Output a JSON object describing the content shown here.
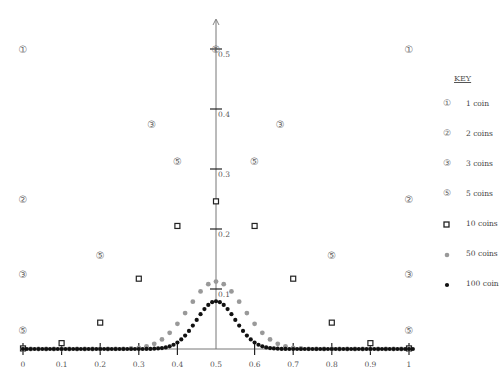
{
  "chart_data": {
    "type": "scatter",
    "title": "",
    "xlabel": "",
    "ylabel": "",
    "xlim": [
      0,
      1
    ],
    "ylim": [
      0,
      0.5
    ],
    "grid": false,
    "legend_position": "right",
    "x_ticks": [
      "0",
      "0.1",
      "0.2",
      "0.3",
      "0.4",
      "0.5",
      "0.6",
      "0.7",
      "0.8",
      "0.9",
      "1"
    ],
    "y_ticks": [
      "0.1",
      "0.2",
      "0.3",
      "0.4",
      "0.5"
    ],
    "legend_title": "KEY",
    "series": [
      {
        "name": "1 coin",
        "marker": "①",
        "x": [
          0,
          1
        ],
        "y": [
          0.5,
          0.5
        ]
      },
      {
        "name": "2 coins",
        "marker": "②",
        "x": [
          0,
          0.5,
          1
        ],
        "y": [
          0.25,
          0.5,
          0.25
        ]
      },
      {
        "name": "3 coins",
        "marker": "③",
        "x": [
          0,
          0.3333,
          0.6667,
          1
        ],
        "y": [
          0.125,
          0.375,
          0.375,
          0.125
        ]
      },
      {
        "name": "5 coins",
        "marker": "⑤",
        "x": [
          0,
          0.2,
          0.4,
          0.6,
          0.8,
          1
        ],
        "y": [
          0.03125,
          0.15625,
          0.3125,
          0.3125,
          0.15625,
          0.03125
        ]
      },
      {
        "name": "10 coins",
        "marker": "square",
        "x": [
          0,
          0.1,
          0.2,
          0.3,
          0.4,
          0.5,
          0.6,
          0.7,
          0.8,
          0.9,
          1
        ],
        "y": [
          0.000977,
          0.009766,
          0.043945,
          0.117188,
          0.205078,
          0.246094,
          0.205078,
          0.117188,
          0.043945,
          0.009766,
          0.000977
        ]
      },
      {
        "name": "50 coins",
        "marker": "gray-dot",
        "n": 50,
        "y": [
          0,
          0,
          0,
          0,
          0,
          0,
          0,
          0,
          0,
          0,
          0,
          0,
          0.0001,
          0.0003,
          0.0008,
          0.002,
          0.0044,
          0.0087,
          0.016,
          0.027,
          0.0419,
          0.0598,
          0.0788,
          0.096,
          0.108,
          0.1123,
          0.108,
          0.096,
          0.0788,
          0.0598,
          0.0419,
          0.027,
          0.016,
          0.0087,
          0.0044,
          0.002,
          0.0008,
          0.0003,
          0.0001,
          0,
          0,
          0,
          0,
          0,
          0,
          0,
          0,
          0,
          0,
          0,
          0
        ]
      },
      {
        "name": "100 coins",
        "marker": "black-dot",
        "n": 100,
        "y": [
          0,
          0,
          0,
          0,
          0,
          0,
          0,
          0,
          0,
          0,
          0,
          0,
          0,
          0,
          0,
          0,
          0,
          0,
          0,
          0,
          0,
          0,
          0,
          0,
          0,
          0,
          0,
          0,
          0,
          0,
          0,
          0,
          0.0001,
          0.0002,
          0.0005,
          0.0009,
          0.0016,
          0.0027,
          0.0045,
          0.0071,
          0.0108,
          0.0159,
          0.0223,
          0.0301,
          0.039,
          0.0485,
          0.058,
          0.0666,
          0.0735,
          0.078,
          0.0796,
          0.078,
          0.0735,
          0.0666,
          0.058,
          0.0485,
          0.039,
          0.0301,
          0.0223,
          0.0159,
          0.0108,
          0.0071,
          0.0045,
          0.0027,
          0.0016,
          0.0009,
          0.0005,
          0.0002,
          0.0001,
          0,
          0,
          0,
          0,
          0,
          0,
          0,
          0,
          0,
          0,
          0,
          0,
          0,
          0,
          0,
          0,
          0,
          0,
          0,
          0,
          0,
          0,
          0,
          0,
          0,
          0,
          0,
          0,
          0,
          0,
          0,
          0,
          0
        ]
      }
    ]
  },
  "key": {
    "title": "KEY",
    "items": [
      {
        "symbol": "①",
        "label": "1 coin"
      },
      {
        "symbol": "②",
        "label": "2 coins"
      },
      {
        "symbol": "③",
        "label": "3 coins"
      },
      {
        "symbol": "⑤",
        "label": "5 coins"
      },
      {
        "symbol": "square",
        "label": "10 coins"
      },
      {
        "symbol": "gray-dot",
        "label": "50 coins"
      },
      {
        "symbol": "black-dot",
        "label": "100 coins"
      }
    ]
  }
}
